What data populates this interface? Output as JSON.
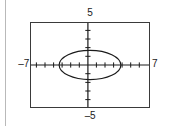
{
  "figure": {
    "name": "graphing-calculator-ellipse-plot",
    "background_color": "#ffffff",
    "frame_color": "#3a3a3a",
    "curve_color": "#1a1a1a",
    "axis_color": "#1a1a1a",
    "margin_rule_color": "#b9b9b9"
  },
  "labels": {
    "top": "5",
    "bottom": "–5",
    "left": "–7",
    "right": "7"
  },
  "chart_data": {
    "type": "line",
    "title": "",
    "subtitle": "",
    "xlabel": "",
    "ylabel": "",
    "xlim": [
      -7,
      7
    ],
    "ylim": [
      -5,
      5
    ],
    "xtick_labels": [
      "–7",
      "7"
    ],
    "ytick_labels": [
      "–5",
      "5"
    ],
    "xscl": 1,
    "yscl": 1,
    "grid": false,
    "legend": null,
    "axes_drawn": true,
    "tick_marks": true,
    "annotations": [],
    "series": [
      {
        "name": "ellipse",
        "kind": "conic-ellipse",
        "equation": "x^2/16 + y^2/4 = 1",
        "center": [
          0,
          0
        ],
        "semi_axis_x": 3.6,
        "semi_axis_y": 1.7,
        "x_intercepts": [
          -3.6,
          3.6
        ],
        "y_intercepts": [
          -1.7,
          1.7
        ],
        "closed": true,
        "color": "#1a1a1a"
      }
    ]
  }
}
